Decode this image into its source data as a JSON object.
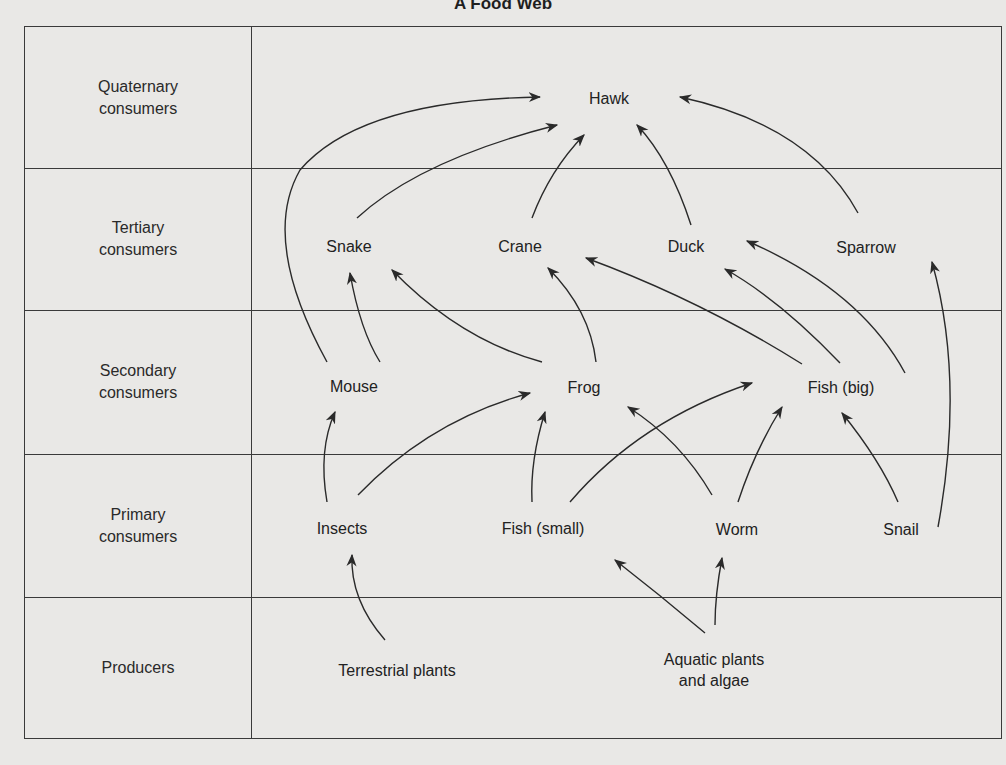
{
  "title": "A Food Web",
  "levels": [
    {
      "label_line1": "Quaternary",
      "label_line2": "consumers"
    },
    {
      "label_line1": "Tertiary",
      "label_line2": "consumers"
    },
    {
      "label_line1": "Secondary",
      "label_line2": "consumers"
    },
    {
      "label_line1": "Primary",
      "label_line2": "consumers"
    },
    {
      "label_line1": "Producers",
      "label_line2": ""
    }
  ],
  "organisms": {
    "hawk": "Hawk",
    "snake": "Snake",
    "crane": "Crane",
    "duck": "Duck",
    "sparrow": "Sparrow",
    "mouse": "Mouse",
    "frog": "Frog",
    "fish_big": "Fish (big)",
    "insects": "Insects",
    "fish_small": "Fish (small)",
    "worm": "Worm",
    "snail": "Snail",
    "terrestrial_plants": "Terrestrial plants",
    "aquatic_line1": "Aquatic plants",
    "aquatic_line2": "and algae"
  },
  "edges": [
    [
      "Terrestrial plants",
      "Insects"
    ],
    [
      "Aquatic plants and algae",
      "Fish (small)"
    ],
    [
      "Aquatic plants and algae",
      "Worm"
    ],
    [
      "Insects",
      "Mouse"
    ],
    [
      "Insects",
      "Frog"
    ],
    [
      "Fish (small)",
      "Frog"
    ],
    [
      "Fish (small)",
      "Fish (big)"
    ],
    [
      "Worm",
      "Frog"
    ],
    [
      "Worm",
      "Fish (big)"
    ],
    [
      "Snail",
      "Fish (big)"
    ],
    [
      "Snail",
      "Sparrow"
    ],
    [
      "Mouse",
      "Snake"
    ],
    [
      "Mouse",
      "Hawk"
    ],
    [
      "Frog",
      "Snake"
    ],
    [
      "Frog",
      "Crane"
    ],
    [
      "Fish (big)",
      "Crane"
    ],
    [
      "Fish (big)",
      "Duck"
    ],
    [
      "Fish (big)",
      "Sparrow"
    ],
    [
      "Snake",
      "Hawk"
    ],
    [
      "Crane",
      "Hawk"
    ],
    [
      "Duck",
      "Hawk"
    ],
    [
      "Sparrow",
      "Hawk"
    ]
  ],
  "colors": {
    "line": "#3a3a3a",
    "background": "#e9e8e6",
    "text": "#2a2a2a"
  }
}
